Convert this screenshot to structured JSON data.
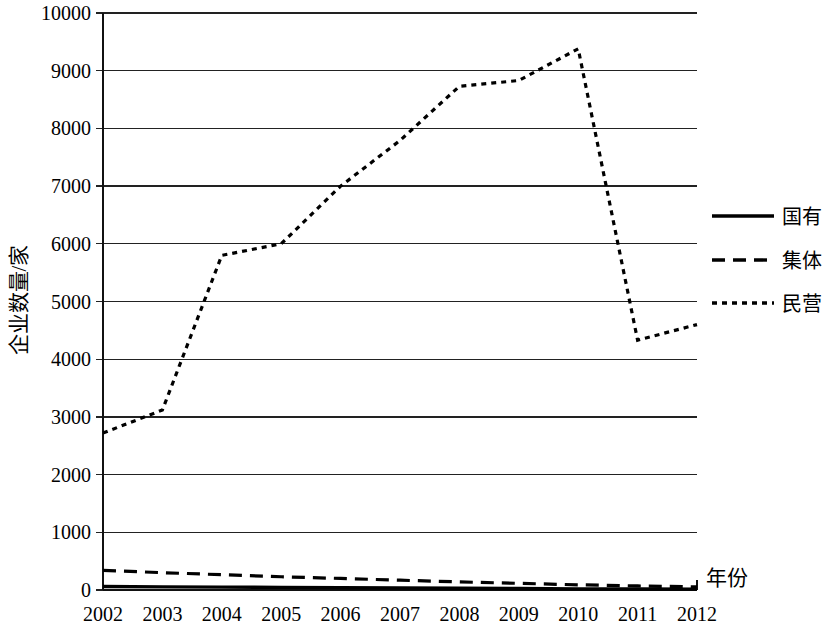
{
  "chart_data": {
    "type": "line",
    "title": "",
    "xlabel": "年份",
    "ylabel": "企业数量/家",
    "categories": [
      "2002",
      "2003",
      "2004",
      "2005",
      "2006",
      "2007",
      "2008",
      "2009",
      "2010",
      "2011",
      "2012"
    ],
    "xlim": [
      2002,
      2012
    ],
    "ylim": [
      0,
      10000
    ],
    "ytick_labels": [
      "0",
      "1000",
      "2000",
      "3000",
      "4000",
      "5000",
      "6000",
      "7000",
      "8000",
      "9000",
      "10000"
    ],
    "ytick_values": [
      0,
      1000,
      2000,
      3000,
      4000,
      5000,
      6000,
      7000,
      8000,
      9000,
      10000
    ],
    "grid": "horizontal",
    "legend_position": "right",
    "series": [
      {
        "name": "国有",
        "style": "solid",
        "values": [
          60,
          55,
          50,
          45,
          40,
          35,
          30,
          25,
          20,
          18,
          15
        ]
      },
      {
        "name": "集体",
        "style": "dashed",
        "values": [
          340,
          300,
          265,
          230,
          200,
          170,
          140,
          115,
          90,
          70,
          55
        ]
      },
      {
        "name": "民营",
        "style": "dotted",
        "values": [
          2720,
          3120,
          5800,
          6000,
          7000,
          7790,
          8730,
          8830,
          9380,
          4330,
          4600
        ]
      }
    ]
  },
  "legend": {
    "items": [
      {
        "label": "国有",
        "style": "solid"
      },
      {
        "label": "集体",
        "style": "dashed"
      },
      {
        "label": "民营",
        "style": "dotted"
      }
    ]
  },
  "axes": {
    "y_title": "企业数量/家",
    "x_title": "年份"
  },
  "colors": {
    "line": "#000000",
    "grid": "#222222",
    "background": "#ffffff"
  }
}
